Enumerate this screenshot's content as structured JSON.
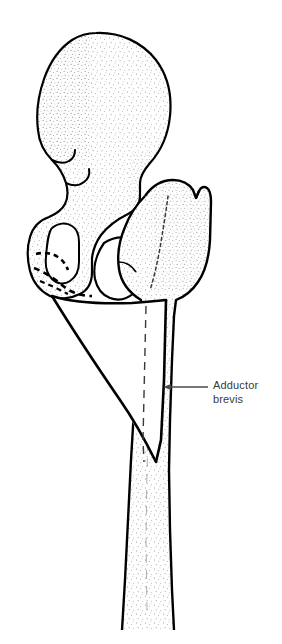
{
  "figure": {
    "name": "adductor-brevis-attachment-diagram",
    "background_color": "#ffffff",
    "ink_color": "#000000",
    "stipple_color": "#555555",
    "label_color": "#3a3a3a"
  },
  "annotations": [
    {
      "id": "adductor-brevis",
      "lines": [
        "Adductor",
        "brevis"
      ],
      "full_text": "Adductor brevis",
      "leader_line": {
        "from_x": 163,
        "from_y": 387,
        "to_x": 208,
        "to_y": 387,
        "arrow": "left"
      },
      "text_x": 213,
      "text_y": 379
    }
  ],
  "structures": [
    {
      "id": "ilium",
      "label": "ilium",
      "texture": "stippled"
    },
    {
      "id": "anterior-superior-iliac-spine",
      "label": "anterior superior iliac spine",
      "texture": "outline"
    },
    {
      "id": "anterior-inferior-iliac-spine",
      "label": "anterior inferior iliac spine",
      "texture": "outline"
    },
    {
      "id": "acetabulum",
      "label": "acetabulum",
      "texture": "stippled"
    },
    {
      "id": "pubis",
      "label": "pubis",
      "texture": "stippled"
    },
    {
      "id": "obturator-foramen",
      "label": "obturator foramen",
      "texture": "blank"
    },
    {
      "id": "femoral-head",
      "label": "head of femur",
      "texture": "stippled"
    },
    {
      "id": "greater-trochanter",
      "label": "greater trochanter",
      "texture": "stippled"
    },
    {
      "id": "lesser-trochanter",
      "label": "lesser trochanter",
      "texture": "stippled"
    },
    {
      "id": "femoral-shaft",
      "label": "shaft of femur",
      "texture": "stippled"
    },
    {
      "id": "adductor-brevis-muscle",
      "label": "adductor brevis",
      "texture": "blank"
    },
    {
      "id": "adductor-brevis-origin",
      "label": "adductor brevis origin on pubis",
      "texture": "dashed"
    },
    {
      "id": "adductor-brevis-insertion",
      "label": "adductor brevis insertion line on femur",
      "texture": "dashed"
    }
  ]
}
